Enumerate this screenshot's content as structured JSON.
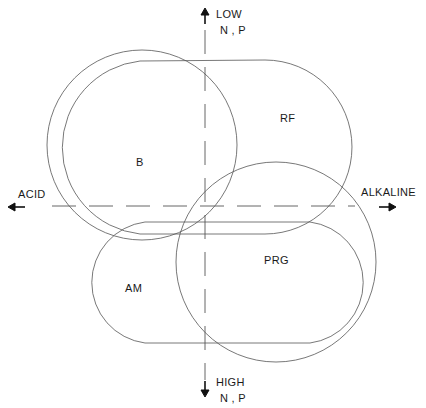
{
  "diagram": {
    "axes": {
      "top": {
        "line1": "LOW",
        "line2": "N , P"
      },
      "bottom": {
        "line1": "HIGH",
        "line2": "N , P"
      },
      "left": "ACID",
      "right": "ALKALINE"
    },
    "regions": [
      {
        "id": "B",
        "label": "B",
        "shape": "circle"
      },
      {
        "id": "RF",
        "label": "RF",
        "shape": "stadium"
      },
      {
        "id": "PRG",
        "label": "PRG",
        "shape": "circle"
      },
      {
        "id": "AM",
        "label": "AM",
        "shape": "stadium"
      }
    ],
    "stroke_color": "#555555",
    "text_color": "#1a1a1a"
  }
}
